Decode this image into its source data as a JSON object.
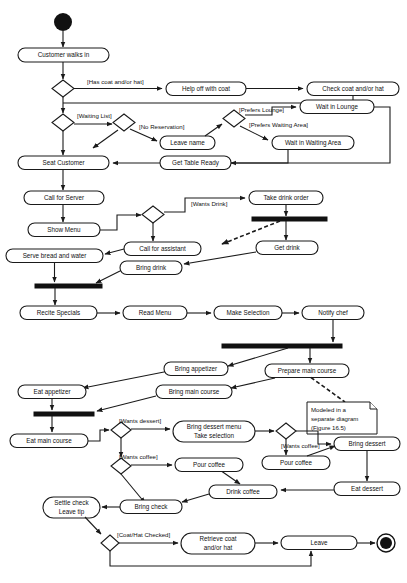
{
  "diagram": {
    "type": "uml-activity-diagram",
    "colors": {
      "stroke": "#1a1a1a",
      "fill": "#ffffff",
      "solid": "#111111"
    }
  },
  "nodes": {
    "customer_walks_in": "Customer walks in",
    "help_off_with_coat": "Help off with coat",
    "check_coat": "Check coat and/or hat",
    "wait_in_lounge": "Wait in Lounge",
    "leave_name": "Leave name",
    "wait_in_waiting_area": "Wait in Waiting Area",
    "seat_customer": "Seat Customer",
    "get_table_ready": "Get Table Ready",
    "call_for_server": "Call for Server",
    "show_menu": "Show Menu",
    "take_drink_order": "Take drink order",
    "call_for_assistant": "Call for assistant",
    "get_drink": "Get drink",
    "serve_bread_and_water": "Serve bread and water",
    "bring_drink": "Bring drink",
    "recite_specials": "Recite Specials",
    "read_menu": "Read Menu",
    "make_selection": "Make Selection",
    "notify_chef": "Notify chef",
    "bring_appetizer": "Bring appetizer",
    "prepare_main_course": "Prepare main course",
    "eat_appetizer": "Eat appetizer",
    "bring_main_course": "Bring main course",
    "eat_main_course": "Eat main course",
    "bring_dessert_menu_line1": "Bring dessert menu",
    "bring_dessert_menu_line2": "Take selection",
    "pour_coffee_left": "Pour coffee",
    "pour_coffee_right": "Pour coffee",
    "bring_dessert": "Bring dessert",
    "drink_coffee": "Drink coffee",
    "eat_dessert": "Eat dessert",
    "settle_check_line1": "Settle check",
    "settle_check_line2": "Leave tip",
    "bring_check": "Bring check",
    "retrieve_coat_line1": "Retrieve coat",
    "retrieve_coat_line2": "and/or hat",
    "leave": "Leave"
  },
  "guards": {
    "has_coat": "[Has coat and/or hat]",
    "waiting_list": "[Waiting List]",
    "no_reservation": "[No Reservation]",
    "prefers_lounge": "[Prefers Lounge]",
    "prefers_waiting_area": "[Prefers Waiting Area]",
    "wants_drink": "[Wants Drink]",
    "wants_dessert": "[Wants dessert]",
    "wants_coffee_left": "[Wants coffee]",
    "wants_coffee_right": "[Wants coffee]",
    "coat_hat_checked": "[Coat/Hat Checked]"
  },
  "note": {
    "line1": "Modeled in a",
    "line2": "separate diagram",
    "line3": "(Figure 16.5)"
  }
}
